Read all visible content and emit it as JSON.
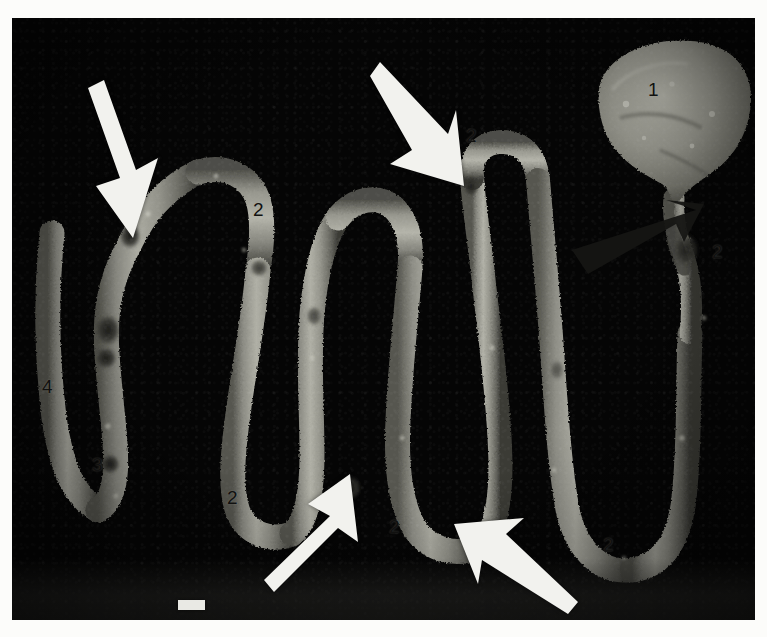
{
  "figure": {
    "kind": "gross-pathology-specimen-photograph",
    "background_color": "#050505",
    "tissue_color": "#8e8e88",
    "tissue_highlight_color": "#bdbdb4",
    "tissue_shadow_color": "#45453f",
    "lesion_color": "#2a2a26",
    "label_color": "#111110",
    "arrow_white_color": "#f2f2ee",
    "arrow_black_color": "#151513"
  },
  "labels": [
    {
      "id": "label-1",
      "text": "1",
      "x": 648,
      "y": 80,
      "note": "bulky tumour mass, upper right"
    },
    {
      "id": "label-2a",
      "text": "2",
      "x": 466,
      "y": 126,
      "note": "dilated bowel segment, upper middle"
    },
    {
      "id": "label-2b",
      "text": "2",
      "x": 253,
      "y": 200,
      "note": "dilated bowel segment, upper left loop"
    },
    {
      "id": "label-2c",
      "text": "2",
      "x": 712,
      "y": 242,
      "note": "dilated bowel segment, right of black arrowhead"
    },
    {
      "id": "label-2d",
      "text": "2",
      "x": 227,
      "y": 488,
      "note": "dilated bowel segment, lower left loop"
    },
    {
      "id": "label-2e",
      "text": "2",
      "x": 389,
      "y": 517,
      "note": "dilated bowel segment, lower middle loop"
    },
    {
      "id": "label-2f",
      "text": "2",
      "x": 603,
      "y": 535,
      "note": "dilated bowel segment, lower right loop"
    },
    {
      "id": "label-3",
      "text": "3",
      "x": 92,
      "y": 455,
      "note": "narrowed / strictured segment, lower left"
    },
    {
      "id": "label-4",
      "text": "4",
      "x": 42,
      "y": 377,
      "note": "collapsed distal bowel limb, far left"
    }
  ],
  "arrows": [
    {
      "id": "arrow-white-top-left",
      "style": "white",
      "tail_x": 88,
      "tail_y": 88,
      "tip_x": 133,
      "tip_y": 238,
      "note": "points to stricture on left loop"
    },
    {
      "id": "arrow-white-top-middle",
      "style": "white",
      "tail_x": 372,
      "tail_y": 82,
      "tip_x": 452,
      "tip_y": 180,
      "note": "points to ulcerated stricture, upper middle"
    },
    {
      "id": "arrow-white-bottom-left",
      "style": "white",
      "tail_x": 282,
      "tail_y": 592,
      "tip_x": 342,
      "tip_y": 480,
      "note": "points to lesion on lower middle loop"
    },
    {
      "id": "arrow-white-bottom-right",
      "style": "white",
      "tail_x": 567,
      "tail_y": 600,
      "tip_x": 472,
      "tip_y": 528,
      "note": "points to lesion on lower middle loop"
    },
    {
      "id": "arrow-black-right",
      "style": "black",
      "tail_x": 597,
      "tail_y": 262,
      "tip_x": 692,
      "tip_y": 213,
      "note": "arrowhead marking abrupt transition below the mass"
    }
  ],
  "scale_bar": {
    "id": "scale-bar",
    "x": 178,
    "y": 600,
    "width": 27,
    "height": 10,
    "color": "#e9e9e4",
    "caption": ""
  },
  "plate": {
    "x": 12,
    "y": 18,
    "width": 743,
    "height": 602
  }
}
